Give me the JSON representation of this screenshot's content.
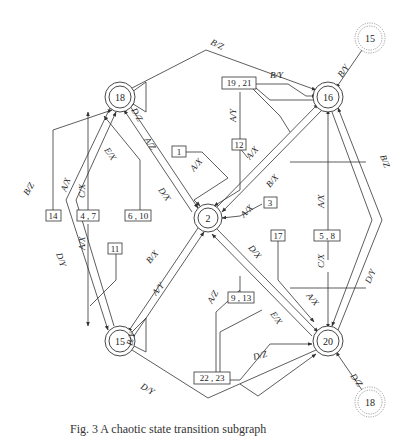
{
  "figure": {
    "caption": "Fig. 3  A chaotic state transition subgraph"
  },
  "nodes": [
    {
      "id": "18",
      "label": "18",
      "kind": "state",
      "x": 120,
      "y": 97
    },
    {
      "id": "16",
      "label": "16",
      "kind": "state",
      "x": 328,
      "y": 97
    },
    {
      "id": "2",
      "label": "2",
      "kind": "state",
      "x": 208,
      "y": 218
    },
    {
      "id": "15",
      "label": "15",
      "kind": "state",
      "x": 120,
      "y": 341
    },
    {
      "id": "20",
      "label": "20",
      "kind": "state",
      "x": 328,
      "y": 341
    },
    {
      "id": "ext15",
      "label": "15",
      "kind": "external",
      "x": 370,
      "y": 38
    },
    {
      "id": "ext18",
      "label": "18",
      "kind": "external",
      "x": 370,
      "y": 402
    }
  ],
  "edge_labels": {
    "top_outer": "B/Z",
    "ext15_to_16": "B/Y",
    "self18": "D/Z",
    "e18_2_a": "A/Z",
    "e18_2_b": "E/X",
    "e2_18": "D/X",
    "left_outer_up": "B/Z",
    "left_outer_down": "D/Y",
    "box14_to_18": "A/X",
    "box47_to_18": "C/X",
    "box47_to_15": "A/X",
    "box1_to_2": "A/X",
    "box1921_to_2": "A/Y",
    "box1921_to_16": "B/Y",
    "box12_to_16": "A/X",
    "box3_to_2": "A/X",
    "e2_16": "B/X",
    "right_outer_up": "B/Z",
    "right_outer_down": "D/Y",
    "box58_to_16": "A/X",
    "box58_to_20": "C/X",
    "e2_20": "D/X",
    "box17_to_20": "A/X",
    "box913_to_20": "E/X",
    "box2223_to_2": "A/Z",
    "box2223_to_20": "D/Z",
    "e15_2": "B/X",
    "e2_15": "A/Y",
    "self15": "B/Y",
    "bottom_outer": "D/Y",
    "ext18_to_20": "D/Z"
  },
  "boxes": {
    "b1": "1",
    "b3": "3",
    "b12": "12",
    "b14": "14",
    "b47": "4 , 7",
    "b610": "6 , 10",
    "b11": "11",
    "b1921": "19 , 21",
    "b17": "17",
    "b58": "5 , 8",
    "b913": "9 , 13",
    "b2223": "22 , 23"
  }
}
